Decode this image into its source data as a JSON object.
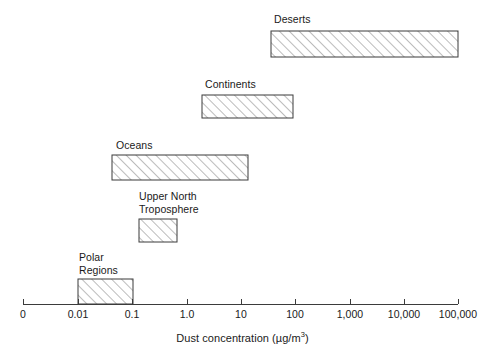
{
  "chart_data": {
    "type": "bar",
    "orientation": "horizontal",
    "title": "",
    "subtitle": "",
    "xlabel": "Dust concentration (µg/m3)",
    "xlabel_base": "Dust concentration (µg/m",
    "xlabel_exponent": "3",
    "xlabel_close": ")",
    "ylabel": "",
    "xscale": "log",
    "grid": false,
    "legend": false,
    "xticks": [
      {
        "label": "0",
        "px": 23
      },
      {
        "label": "0.01",
        "px": 78
      },
      {
        "label": "0.1",
        "px": 132
      },
      {
        "label": "1.0",
        "px": 187
      },
      {
        "label": "10",
        "px": 241
      },
      {
        "label": "100",
        "px": 295
      },
      {
        "label": "1,000",
        "px": 350
      },
      {
        "label": "10,000",
        "px": 404
      },
      {
        "label": "100,000",
        "px": 458
      }
    ],
    "categories": [
      "Deserts",
      "Continents",
      "Oceans",
      "Upper North Troposphere",
      "Polar Regions"
    ],
    "bars": [
      {
        "label": "Deserts",
        "label_lines": [
          "Deserts"
        ],
        "low": 30,
        "high": 100000,
        "low_px": 271,
        "high_px": 458,
        "top_px": 31,
        "height_px": 26,
        "label_x_px": 274,
        "label_y_px": 13
      },
      {
        "label": "Continents",
        "label_lines": [
          "Continents"
        ],
        "low": 2,
        "high": 300,
        "low_px": 202,
        "high_px": 293,
        "top_px": 95,
        "height_px": 23,
        "label_x_px": 205,
        "label_y_px": 78
      },
      {
        "label": "Oceans",
        "label_lines": [
          "Oceans"
        ],
        "low": 0.03,
        "high": 20,
        "low_px": 112,
        "high_px": 248,
        "top_px": 155,
        "height_px": 25,
        "label_x_px": 116,
        "label_y_px": 139
      },
      {
        "label": "Upper North Troposphere",
        "label_lines": [
          "Upper North",
          "Troposphere"
        ],
        "low": 0.2,
        "high": 1.5,
        "low_px": 139,
        "high_px": 177,
        "top_px": 219,
        "height_px": 23,
        "label_x_px": 139,
        "label_y_px": 190
      },
      {
        "label": "Polar Regions",
        "label_lines": [
          "Polar",
          "Regions"
        ],
        "low": 0.01,
        "high": 0.1,
        "low_px": 78,
        "high_px": 133,
        "top_px": 279,
        "height_px": 25,
        "label_x_px": 79,
        "label_y_px": 251
      }
    ],
    "axis": {
      "line_y_px": 304,
      "left_px": 23,
      "right_px": 458,
      "tick_len_px": 5,
      "tick_label_y_px": 308
    },
    "colors": {
      "stroke": "#3b3b3b",
      "hatch": "#7a7a7a",
      "text": "#1a1a1a",
      "background": "#ffffff"
    }
  }
}
